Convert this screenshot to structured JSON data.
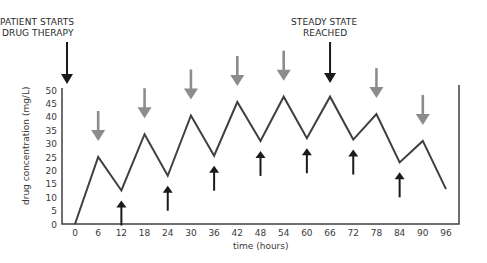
{
  "chart_data": {
    "type": "line",
    "title": "",
    "xlabel": "time (hours)",
    "ylabel": "drug concentration (mg/L)",
    "xlim": [
      0,
      96
    ],
    "ylim": [
      0,
      50
    ],
    "x_ticks": [
      0,
      6,
      12,
      18,
      24,
      30,
      36,
      42,
      48,
      54,
      60,
      66,
      72,
      78,
      84,
      90,
      96
    ],
    "y_ticks": [
      0,
      5,
      10,
      15,
      20,
      25,
      30,
      35,
      40,
      45,
      50
    ],
    "grid": false,
    "legend": null,
    "series": [
      {
        "name": "drug concentration",
        "x": [
          0,
          6,
          12,
          18,
          24,
          30,
          36,
          42,
          48,
          54,
          60,
          66,
          72,
          78,
          84,
          90,
          96
        ],
        "values": [
          0,
          25,
          12.5,
          33.5,
          18,
          40.5,
          25.5,
          45.5,
          31,
          47.5,
          32,
          47.5,
          31.5,
          41,
          23,
          31,
          13
        ]
      }
    ],
    "annotations": [
      {
        "text": "PATIENT STARTS",
        "text2": "DRUG THERAPY",
        "x": 0,
        "type": "black-down-arrow"
      },
      {
        "text": "STEADY STATE",
        "text2": "REACHED",
        "x": 66,
        "type": "black-down-arrow"
      }
    ],
    "gray_down_arrows_at_hours": [
      6,
      18,
      30,
      42,
      54,
      78,
      90
    ],
    "black_up_arrows_at_hours": [
      12,
      24,
      36,
      48,
      60,
      72,
      84
    ]
  },
  "colors": {
    "line": "#3f3f3f",
    "axis": "#3f3f3f",
    "gray_arrow": "#8c8c8c",
    "black_arrow": "#1a1a1a"
  }
}
